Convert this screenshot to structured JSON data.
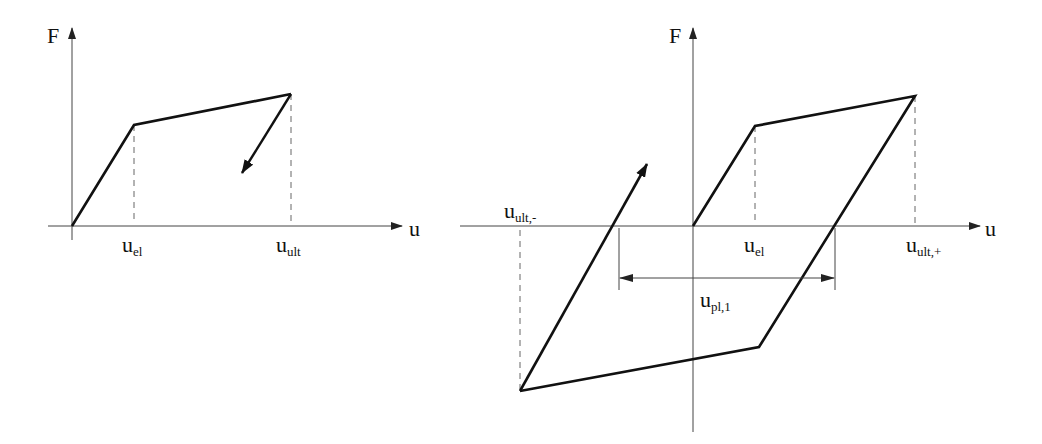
{
  "left_diagram": {
    "title": "monotonic force-displacement (bilinear)",
    "axis_y_label": "F",
    "axis_x_label": "u",
    "points": {
      "origin": [
        72,
        226
      ],
      "elastic_limit": [
        134,
        125
      ],
      "ultimate": [
        291,
        94
      ],
      "unload_arrow_end": [
        242,
        173
      ]
    },
    "labels": {
      "u_el": {
        "base": "u",
        "sub": "el"
      },
      "u_ult": {
        "base": "u",
        "sub": "ult"
      }
    }
  },
  "right_diagram": {
    "title": "cyclic hysteresis loop",
    "axis_y_label": "F",
    "axis_x_label": "u",
    "points": {
      "origin": [
        693,
        226
      ],
      "elastic_limit": [
        755,
        126
      ],
      "ultimate_pos": [
        915,
        96
      ],
      "zero_crossing_unload": [
        835,
        226
      ],
      "lower_right_corner": [
        759,
        347
      ],
      "ultimate_neg": [
        520,
        391
      ],
      "zero_crossing_reload": [
        619,
        226
      ],
      "reload_arrow_tip": [
        647,
        164
      ]
    },
    "labels": {
      "u_ult_neg": {
        "base": "u",
        "sub": "ult,-"
      },
      "u_el": {
        "base": "u",
        "sub": "el"
      },
      "u_ult_pos": {
        "base": "u",
        "sub": "ult,+"
      },
      "u_pl_1": {
        "base": "u",
        "sub": "pl,1"
      }
    }
  },
  "colors": {
    "line": "#111111",
    "axis": "#444444",
    "dashed": "#666666",
    "background": "#ffffff"
  }
}
